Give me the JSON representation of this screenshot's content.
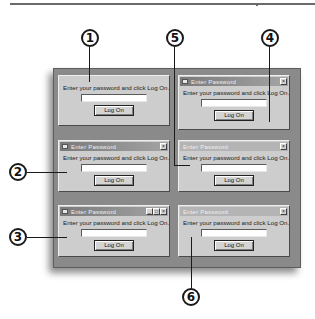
{
  "callouts": [
    {
      "id": "1",
      "label": "1"
    },
    {
      "id": "2",
      "label": "2"
    },
    {
      "id": "3",
      "label": "3"
    },
    {
      "id": "4",
      "label": "4"
    },
    {
      "id": "5",
      "label": "5"
    },
    {
      "id": "6",
      "label": "6"
    }
  ],
  "dialogs": [
    {
      "callout": "1",
      "title": "",
      "titlebar": "none",
      "buttons": [],
      "prompt": "Enter your password and click Log On.",
      "password_value": "",
      "button_label": "Log On"
    },
    {
      "callout": "4",
      "title": "Enter Password",
      "titlebar": "active",
      "buttons": [
        "close"
      ],
      "prompt": "Enter your password and click Log On.",
      "password_value": "",
      "button_label": "Log On"
    },
    {
      "callout": "2",
      "title": "Enter Password",
      "titlebar": "active",
      "buttons": [
        "close"
      ],
      "prompt": "Enter your password and click Log On.",
      "password_value": "",
      "button_label": "Log On"
    },
    {
      "callout": "5",
      "title": "Enter Password",
      "titlebar": "inactive",
      "buttons": [
        "close"
      ],
      "prompt": "Enter your password and click Log On.",
      "password_value": "",
      "button_label": "Log On"
    },
    {
      "callout": "3",
      "title": "Enter Password",
      "titlebar": "active",
      "buttons": [
        "minimize",
        "maximize",
        "close"
      ],
      "prompt": "Enter your password and click Log On.",
      "password_value": "",
      "button_label": "Log On"
    },
    {
      "callout": "6",
      "title": "Enter Password",
      "titlebar": "inactive",
      "buttons": [
        "close"
      ],
      "prompt": "Enter your password and click Log On.",
      "password_value": "",
      "button_label": "Log On"
    }
  ],
  "glyphs": {
    "close": "×",
    "minimize": "_",
    "maximize": "□"
  }
}
